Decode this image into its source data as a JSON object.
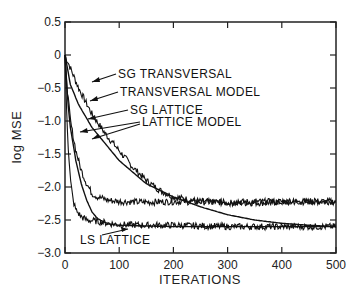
{
  "chart_data": {
    "type": "line",
    "title": "",
    "xlabel": "ITERATIONS",
    "ylabel": "log MSE",
    "xlim": [
      0,
      500
    ],
    "ylim": [
      -3.0,
      0.5
    ],
    "xticks": [
      0,
      100,
      200,
      300,
      400,
      500
    ],
    "xtick_labels": [
      "0",
      "100",
      "200",
      "300",
      "400",
      "500"
    ],
    "yticks": [
      0.5,
      0,
      -0.5,
      -1.0,
      -1.5,
      -2.0,
      -2.5,
      -3.0
    ],
    "ytick_labels": [
      "0.5",
      "0",
      "-0.5",
      "-1.0",
      "-1.5",
      "-2.0",
      "-2.5",
      "-3.0"
    ],
    "grid": false,
    "legend_position": "inline annotations with arrows",
    "series": [
      {
        "name": "SG TRANSVERSAL",
        "noisy": true,
        "x": [
          0,
          10,
          25,
          50,
          75,
          100,
          125,
          150,
          175,
          200,
          250,
          300,
          350,
          400,
          450,
          500
        ],
        "values": [
          0.0,
          -0.2,
          -0.5,
          -0.9,
          -1.2,
          -1.45,
          -1.7,
          -1.9,
          -2.05,
          -2.15,
          -2.22,
          -2.24,
          -2.24,
          -2.23,
          -2.22,
          -2.22
        ]
      },
      {
        "name": "TRANSVERSAL MODEL",
        "noisy": false,
        "x": [
          0,
          10,
          25,
          50,
          75,
          100,
          150,
          200,
          250,
          300,
          350,
          400,
          450,
          500
        ],
        "values": [
          0.0,
          -0.45,
          -0.75,
          -1.1,
          -1.35,
          -1.6,
          -1.95,
          -2.15,
          -2.3,
          -2.42,
          -2.5,
          -2.55,
          -2.58,
          -2.6
        ]
      },
      {
        "name": "SG LATTICE",
        "noisy": true,
        "x": [
          0,
          5,
          10,
          20,
          30,
          40,
          50,
          60,
          80,
          100,
          150,
          200,
          300,
          400,
          500
        ],
        "values": [
          0.0,
          -0.6,
          -1.0,
          -1.45,
          -1.75,
          -1.95,
          -2.1,
          -2.15,
          -2.2,
          -2.22,
          -2.23,
          -2.22,
          -2.23,
          -2.22,
          -2.22
        ]
      },
      {
        "name": "LATTICE MODEL",
        "noisy": false,
        "x": [
          0,
          5,
          10,
          20,
          30,
          40,
          50,
          60,
          80,
          100,
          150,
          200,
          300,
          400,
          500
        ],
        "values": [
          0.0,
          -0.7,
          -1.1,
          -1.6,
          -1.95,
          -2.2,
          -2.38,
          -2.48,
          -2.56,
          -2.58,
          -2.59,
          -2.6,
          -2.6,
          -2.6,
          -2.6
        ]
      },
      {
        "name": "LS LATTICE",
        "noisy": true,
        "x": [
          0,
          3,
          6,
          10,
          15,
          20,
          30,
          40,
          60,
          80,
          100,
          150,
          200,
          300,
          400,
          500
        ],
        "values": [
          0.0,
          -0.8,
          -1.4,
          -1.9,
          -2.2,
          -2.35,
          -2.45,
          -2.5,
          -2.52,
          -2.55,
          -2.57,
          -2.58,
          -2.58,
          -2.6,
          -2.6,
          -2.6
        ]
      }
    ],
    "annotations": [
      {
        "text": "SG TRANSVERSAL",
        "points_to_series": "SG TRANSVERSAL"
      },
      {
        "text": "TRANSVERSAL MODEL",
        "points_to_series": "TRANSVERSAL MODEL"
      },
      {
        "text": "SG LATTICE",
        "points_to_series": "SG LATTICE"
      },
      {
        "text": "LATTICE MODEL",
        "points_to_series": "LATTICE MODEL"
      },
      {
        "text": "LS LATTICE",
        "points_to_series": "LS LATTICE"
      }
    ]
  },
  "labels": {
    "ylabel": "log MSE",
    "xlabel": "ITERATIONS",
    "anno_sg_transversal": "SG TRANSVERSAL",
    "anno_transversal_model": "TRANSVERSAL MODEL",
    "anno_sg_lattice": "SG LATTICE",
    "anno_lattice_model": "LATTICE MODEL",
    "anno_ls_lattice": "LS LATTICE"
  },
  "colors": {
    "line": "#111111",
    "axis": "#222222",
    "background": "#ffffff"
  }
}
